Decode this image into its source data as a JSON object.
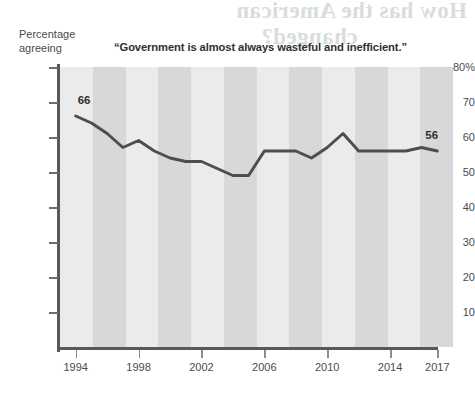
{
  "axis_caption": "Percentage\nagreeing",
  "axis_caption_line1": "Percentage",
  "axis_caption_line2": "agreeing",
  "title": "“Government is almost always wasteful and inefficient.”",
  "bleed_text": {
    "head_line_1": "How has the American",
    "head_line_2": "changed?",
    "sub_line_1": "The public has become less",
    "sub_line_2": "trusting"
  },
  "colors": {
    "line": "#4e4e4e",
    "axis": "#595959",
    "band_light": "#ebebeb",
    "band_dark": "#d8d8d8",
    "text": "#3a3a3a"
  },
  "labels": {
    "start_value": "66",
    "end_value": "56"
  },
  "chart_data": {
    "type": "line",
    "title": "“Government is almost always wasteful and inefficient.”",
    "xlabel": "",
    "ylabel": "Percentage agreeing",
    "xlim": [
      1993,
      2018
    ],
    "ylim": [
      0,
      80
    ],
    "yticks": [
      10,
      20,
      30,
      40,
      50,
      60,
      70,
      80
    ],
    "ytick_labels": [
      "10",
      "20",
      "30",
      "40",
      "50",
      "60",
      "70",
      "80%"
    ],
    "xticks": [
      1994,
      1998,
      2002,
      2006,
      2010,
      2014,
      2017
    ],
    "xtick_labels": [
      "1994",
      "1998",
      "2002",
      "2006",
      "2010",
      "2014",
      "2017"
    ],
    "grid": false,
    "legend": false,
    "annotations": [
      {
        "x": 1994,
        "y": 66,
        "text": "66"
      },
      {
        "x": 2017,
        "y": 56,
        "text": "56"
      }
    ],
    "series": [
      {
        "name": "Government is almost always wasteful and inefficient",
        "x": [
          1994,
          1995,
          1996,
          1997,
          1998,
          1999,
          2000,
          2001,
          2002,
          2003,
          2004,
          2005,
          2006,
          2007,
          2008,
          2009,
          2010,
          2011,
          2012,
          2013,
          2014,
          2015,
          2016,
          2017
        ],
        "values": [
          66,
          64,
          61,
          57,
          59,
          56,
          54,
          53,
          53,
          51,
          49,
          49,
          56,
          56,
          56,
          54,
          57,
          61,
          56,
          56,
          56,
          56,
          57,
          56
        ]
      }
    ]
  }
}
